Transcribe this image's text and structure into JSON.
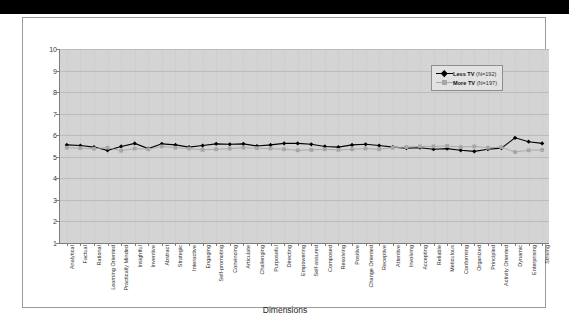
{
  "figure": {
    "x_axis_title": "Dimensions"
  },
  "legend": {
    "position": "top-right-inside",
    "entries": [
      {
        "label": "Less TV",
        "n_text": "(N=192)",
        "color": "#000000",
        "marker": "diamond"
      },
      {
        "label": "More TV",
        "n_text": "(N=197)",
        "color": "#a6a6a6",
        "marker": "square"
      }
    ]
  },
  "chart_data": {
    "type": "line",
    "title": "",
    "xlabel": "Dimensions",
    "ylabel": "",
    "ylim": [
      1,
      10
    ],
    "yticks": [
      1,
      2,
      3,
      4,
      5,
      6,
      7,
      8,
      9,
      10
    ],
    "grid": true,
    "categories": [
      "Analytical",
      "Factual",
      "Rational",
      "Learning Oriented",
      "Practically Minded",
      "Insightful",
      "Inventive",
      "Abstract",
      "Strategic",
      "Interactive",
      "Engaging",
      "Self-promoting",
      "Convincing",
      "Articulate",
      "Challenging",
      "Purposeful",
      "Directing",
      "Empowering",
      "Self-assured",
      "Composed",
      "Resolving",
      "Positive",
      "Change Oriented",
      "Receptive",
      "Attentive",
      "Involving",
      "Accepting",
      "Reliable",
      "Meticulous",
      "Conforming",
      "Organized",
      "Principled",
      "Activity Oriented",
      "Dynamic",
      "Enterprising",
      "Striving"
    ],
    "series": [
      {
        "name": "Less TV (N=192)",
        "color": "#000000",
        "marker": "diamond",
        "values": [
          5.55,
          5.52,
          5.45,
          5.3,
          5.48,
          5.62,
          5.38,
          5.6,
          5.55,
          5.45,
          5.52,
          5.6,
          5.58,
          5.6,
          5.5,
          5.55,
          5.62,
          5.62,
          5.58,
          5.48,
          5.45,
          5.55,
          5.58,
          5.52,
          5.45,
          5.4,
          5.42,
          5.35,
          5.38,
          5.3,
          5.25,
          5.35,
          5.4,
          5.88,
          5.7,
          5.62
        ]
      },
      {
        "name": "More TV (N=197)",
        "color": "#a6a6a6",
        "marker": "square",
        "values": [
          5.42,
          5.4,
          5.38,
          5.42,
          5.28,
          5.38,
          5.35,
          5.48,
          5.42,
          5.38,
          5.32,
          5.35,
          5.38,
          5.42,
          5.4,
          5.38,
          5.35,
          5.3,
          5.32,
          5.35,
          5.32,
          5.35,
          5.38,
          5.35,
          5.42,
          5.45,
          5.48,
          5.48,
          5.5,
          5.45,
          5.48,
          5.42,
          5.45,
          5.22,
          5.3,
          5.32
        ]
      }
    ]
  }
}
